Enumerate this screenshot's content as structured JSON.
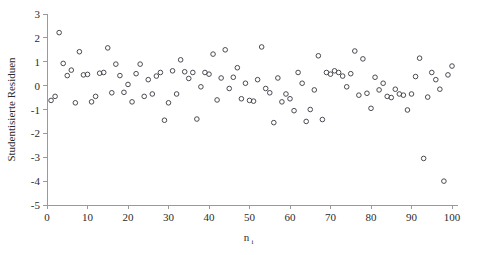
{
  "chart_data": {
    "type": "scatter",
    "title": "",
    "xlabel": "n",
    "xlabel_sub": "i",
    "ylabel": "Studentisierte Residuen",
    "xlim": [
      0,
      100
    ],
    "ylim": [
      -5,
      3
    ],
    "xticks": [
      0,
      10,
      20,
      30,
      40,
      50,
      60,
      70,
      80,
      90,
      100
    ],
    "yticks": [
      3,
      2,
      1,
      0,
      -1,
      -2,
      -3,
      -4,
      -5
    ],
    "xticklabels": [
      "0",
      "10",
      "20",
      "30",
      "40",
      "50",
      "60",
      "70",
      "80",
      "90",
      "100"
    ],
    "yticklabels": [
      "3",
      "2",
      "1",
      "0",
      "-1",
      "-2",
      "-3",
      "-4",
      "-5"
    ],
    "grid": false,
    "legend": null,
    "marker": {
      "shape": "circle-open",
      "radius_px": 2.3,
      "stroke_color": "#4a4a52",
      "fill": "none"
    },
    "series": [
      {
        "name": "Studentisierte Residuen",
        "x": [
          1,
          2,
          3,
          4,
          5,
          6,
          7,
          8,
          9,
          10,
          11,
          12,
          13,
          14,
          15,
          16,
          17,
          18,
          19,
          20,
          21,
          22,
          23,
          24,
          25,
          26,
          27,
          28,
          29,
          30,
          31,
          32,
          33,
          34,
          35,
          36,
          37,
          38,
          39,
          40,
          41,
          42,
          43,
          44,
          45,
          46,
          47,
          48,
          49,
          50,
          51,
          52,
          53,
          54,
          55,
          56,
          57,
          58,
          59,
          60,
          61,
          62,
          63,
          64,
          65,
          66,
          67,
          68,
          69,
          70,
          71,
          72,
          73,
          74,
          75,
          76,
          77,
          78,
          79,
          80,
          81,
          82,
          83,
          84,
          85,
          86,
          87,
          88,
          89,
          90,
          91,
          92,
          93,
          94,
          95,
          96,
          97,
          98,
          99,
          100
        ],
        "y": [
          -0.62,
          -0.45,
          2.22,
          0.93,
          0.42,
          0.65,
          -0.72,
          1.42,
          0.45,
          0.47,
          -0.68,
          -0.45,
          0.52,
          0.55,
          1.58,
          -0.3,
          0.9,
          0.42,
          -0.28,
          0.05,
          -0.68,
          0.5,
          0.9,
          -0.45,
          0.25,
          -0.35,
          0.4,
          0.55,
          -1.45,
          -0.72,
          0.62,
          -0.35,
          1.08,
          0.58,
          0.3,
          0.55,
          -1.4,
          -0.05,
          0.55,
          0.48,
          1.32,
          -0.6,
          0.32,
          1.5,
          -0.12,
          0.35,
          0.75,
          -0.55,
          0.1,
          -0.62,
          -0.65,
          0.25,
          1.62,
          -0.12,
          -0.3,
          -1.55,
          0.32,
          -0.68,
          -0.35,
          -0.55,
          -1.05,
          0.55,
          0.1,
          -1.5,
          -1.0,
          -0.18,
          1.25,
          -1.42,
          0.55,
          0.48,
          0.62,
          0.55,
          0.4,
          -0.05,
          0.5,
          1.45,
          -0.4,
          1.12,
          -0.32,
          -0.95,
          0.35,
          -0.18,
          0.1,
          -0.45,
          -0.5,
          -0.15,
          -0.35,
          -0.4,
          -1.02,
          -0.35,
          0.38,
          1.15,
          -3.05,
          -0.48,
          0.55,
          0.25,
          -0.15,
          -4.0,
          0.45,
          0.82
        ]
      }
    ]
  },
  "axes": {
    "y_axis_label": "Studentisierte Residuen",
    "x_axis_label": "n",
    "x_axis_label_subscript": "i"
  }
}
